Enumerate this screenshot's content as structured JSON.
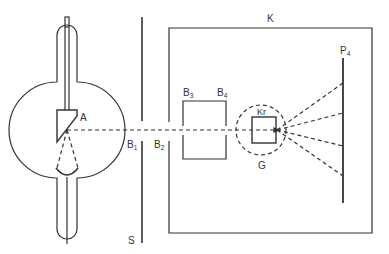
{
  "diagram": {
    "type": "x-ray scattering apparatus schematic",
    "colors": {
      "stroke": "#333333",
      "background": "#ffffff"
    },
    "labels": {
      "anode": "A",
      "slit_screen": "S",
      "slit1": {
        "base": "B",
        "sub": "1"
      },
      "slit2": {
        "base": "B",
        "sub": "2"
      },
      "slit3": {
        "base": "B",
        "sub": "3"
      },
      "slit4": {
        "base": "B",
        "sub": "4"
      },
      "chamber": "K",
      "crystal": "Kr",
      "goniometer": "G",
      "film": {
        "base": "P",
        "sub": "4"
      }
    },
    "components": [
      {
        "id": "xray-tube",
        "description": "X-ray tube with anode A and cathode cup"
      },
      {
        "id": "slit-screen",
        "label": "S",
        "description": "Screen with slit B1"
      },
      {
        "id": "chamber",
        "label": "K",
        "description": "Enclosure with entrance slit B2"
      },
      {
        "id": "collimator",
        "description": "Collimator box with slits B3 and B4"
      },
      {
        "id": "crystal",
        "label": "Kr",
        "description": "Crystal inside goniometer circle G"
      },
      {
        "id": "film",
        "label": "P4",
        "description": "Photographic plate receiving diffracted rays"
      }
    ],
    "diffracted_rays": 4
  }
}
